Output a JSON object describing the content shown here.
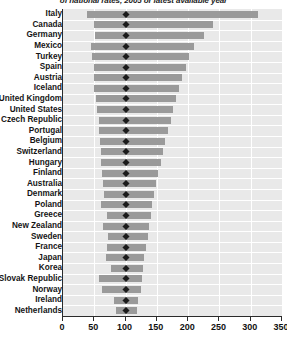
{
  "chart_title": "of national rates, 2005 or latest available year",
  "chart_data": {
    "type": "bar",
    "orientation": "horizontal",
    "subtype": "floating-range-bar-with-marker",
    "title": "of national rates, 2005 or latest available year",
    "xlabel": "",
    "ylabel": "",
    "xlim": [
      0,
      350
    ],
    "ylim": null,
    "grid": true,
    "legend": null,
    "xticks": [
      0,
      50,
      100,
      150,
      200,
      250,
      300,
      350
    ],
    "xticklabels": [
      "0",
      "50",
      "100",
      "150",
      "200",
      "250",
      "300",
      "350"
    ],
    "marker_value": 100,
    "marker_label": "national average (index = 100)",
    "categories": [
      "Italy",
      "Canada",
      "Germany",
      "Mexico",
      "Turkey",
      "Spain",
      "Austria",
      "Iceland",
      "United Kingdom",
      "United States",
      "Czech Republic",
      "Portugal",
      "Belgium",
      "Switzerland",
      "Hungary",
      "Finland",
      "Australia",
      "Denmark",
      "Poland",
      "Greece",
      "New Zealand",
      "Sweden",
      "France",
      "Japan",
      "Korea",
      "Slovak Republic",
      "Norway",
      "Ireland",
      "Netherlands"
    ],
    "series": [
      {
        "name": "range low",
        "values": [
          38,
          49,
          51,
          44,
          46,
          49,
          50,
          50,
          52,
          55,
          57,
          57,
          59,
          60,
          60,
          62,
          64,
          66,
          60,
          70,
          64,
          72,
          70,
          68,
          76,
          57,
          62,
          82,
          85
        ]
      },
      {
        "name": "range high",
        "values": [
          312,
          240,
          226,
          210,
          202,
          196,
          190,
          186,
          180,
          176,
          172,
          168,
          163,
          160,
          156,
          152,
          148,
          145,
          142,
          140,
          138,
          136,
          133,
          130,
          128,
          126,
          124,
          120,
          118
        ]
      }
    ],
    "markers": [
      100,
      100,
      100,
      100,
      100,
      100,
      100,
      100,
      100,
      100,
      100,
      100,
      100,
      100,
      100,
      100,
      100,
      100,
      100,
      100,
      100,
      100,
      100,
      100,
      100,
      100,
      100,
      100,
      100
    ]
  },
  "colors": {
    "bar": "#9a9a9a",
    "plot_background": "#e9e9e9",
    "gridline": "#ffffff",
    "axis": "#2b2b2b",
    "marker": "#1b1b1b",
    "text": "#151515"
  }
}
